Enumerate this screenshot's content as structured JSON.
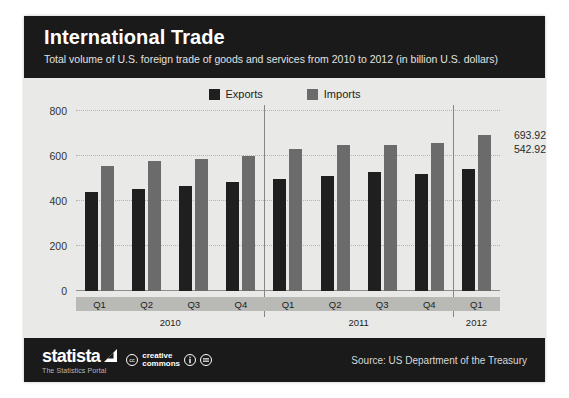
{
  "header": {
    "title": "International Trade",
    "subtitle": "Total volume of U.S. foreign trade of goods and services from 2010 to 2012 (in billion U.S. dollars)"
  },
  "legend": [
    {
      "label": "Exports",
      "color": "#201f1f"
    },
    {
      "label": "Imports",
      "color": "#6b6b6b"
    }
  ],
  "callouts": {
    "imports_last": "693.92",
    "exports_last": "542.92"
  },
  "footer": {
    "brand_name": "statista",
    "brand_tagline": "The Statistics Portal",
    "cc_line1": "creative",
    "cc_line2": "commons",
    "cc_mark": "cc",
    "source": "Source: US Department of the Treasury"
  },
  "chart_data": {
    "type": "bar",
    "title": "International Trade",
    "subtitle": "Total volume of U.S. foreign trade of goods and services from 2010 to 2012 (in billion U.S. dollars)",
    "xlabel": "",
    "ylabel": "",
    "ylim": [
      0,
      800
    ],
    "yticks": [
      0,
      200,
      400,
      600,
      800
    ],
    "grid": true,
    "legend_position": "top-center",
    "categories": [
      "Q1",
      "Q2",
      "Q3",
      "Q4",
      "Q1",
      "Q2",
      "Q3",
      "Q4",
      "Q1"
    ],
    "year_groups": [
      {
        "year": "2010",
        "quarters": 4
      },
      {
        "year": "2011",
        "quarters": 4
      },
      {
        "year": "2012",
        "quarters": 1
      }
    ],
    "series": [
      {
        "name": "Exports",
        "color": "#201f1f",
        "values": [
          442,
          455,
          465,
          483,
          500,
          512,
          527,
          518,
          542.92
        ]
      },
      {
        "name": "Imports",
        "color": "#6b6b6b",
        "values": [
          557,
          577,
          588,
          600,
          632,
          648,
          651,
          657,
          693.92
        ]
      }
    ],
    "annotations": [
      {
        "text": "693.92",
        "series": "Imports",
        "category_index": 8
      },
      {
        "text": "542.92",
        "series": "Exports",
        "category_index": 8
      }
    ]
  }
}
